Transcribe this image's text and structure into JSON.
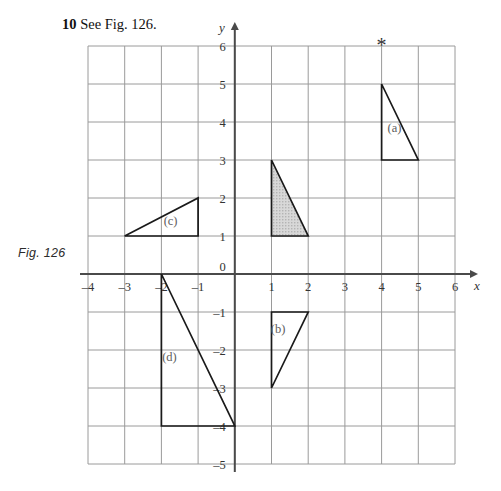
{
  "heading": {
    "number": "10",
    "text": "See Fig. 126."
  },
  "figure_caption": "Fig. 126",
  "chart_data": {
    "type": "scatter",
    "title": "",
    "xlabel": "x",
    "ylabel": "y",
    "xlim": [
      -4,
      6
    ],
    "ylim": [
      -5,
      6
    ],
    "grid": true,
    "grid_step": 1,
    "legend": "none",
    "x_ticks": [
      "-4",
      "-3",
      "-2",
      "-1",
      "0",
      "1",
      "2",
      "3",
      "4",
      "5",
      "6"
    ],
    "x_tick_values": [
      -4,
      -3,
      -2,
      -1,
      0,
      1,
      2,
      3,
      4,
      5,
      6
    ],
    "y_ticks": [
      "6",
      "5",
      "4",
      "3",
      "2",
      "1",
      "0",
      "-1",
      "-2",
      "-3",
      "-4",
      "-5"
    ],
    "y_tick_values": [
      6,
      5,
      4,
      3,
      2,
      1,
      0,
      -1,
      -2,
      -3,
      -4,
      -5
    ],
    "shapes": [
      {
        "label": "(a)",
        "type": "triangle",
        "points": [
          [
            4,
            5
          ],
          [
            4,
            3
          ],
          [
            5,
            3
          ]
        ],
        "fill": "none",
        "label_pos": [
          4.35,
          3.75
        ]
      },
      {
        "label": "(b)",
        "type": "triangle",
        "points": [
          [
            1,
            -1
          ],
          [
            2,
            -1
          ],
          [
            1,
            -3
          ]
        ],
        "fill": "none",
        "label_pos": [
          1.18,
          -1.55
        ]
      },
      {
        "label": "(c)",
        "type": "triangle",
        "points": [
          [
            -3,
            1
          ],
          [
            -1,
            2
          ],
          [
            -1,
            1
          ]
        ],
        "fill": "none",
        "label_pos": [
          -1.75,
          1.3
        ]
      },
      {
        "label": "(d)",
        "type": "triangle",
        "points": [
          [
            -2,
            0
          ],
          [
            -2,
            -4
          ],
          [
            0,
            -4
          ]
        ],
        "fill": "none",
        "label_pos": [
          -1.78,
          -2.3
        ]
      },
      {
        "label": "",
        "type": "triangle",
        "points": [
          [
            1,
            3
          ],
          [
            1,
            1
          ],
          [
            2,
            1
          ]
        ],
        "fill": "shaded",
        "label_pos": null
      }
    ],
    "markers": [
      {
        "symbol": "*",
        "point": [
          4,
          6
        ]
      }
    ]
  },
  "colors": {
    "grid": "#9a9a9a",
    "axis": "#4a4a4a",
    "shape_stroke": "#1a1a1a",
    "shape_fill": "#d2d2d2",
    "text": "#333333"
  }
}
